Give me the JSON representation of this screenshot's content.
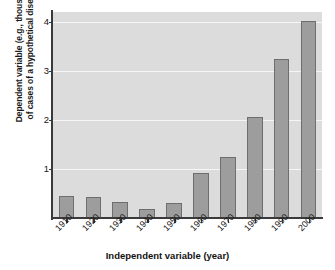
{
  "chart_data": {
    "type": "bar",
    "title": "",
    "xlabel": "Independent variable (year)",
    "ylabel": "Dependent variable (e.g., thousands of cases of a hypothetical disease)",
    "ylabel_line1": "Dependent variable (e.g., thousands",
    "ylabel_line2": "of cases of a hypothetical disease)",
    "categories": [
      "1910",
      "1920",
      "1930",
      "1940",
      "1950",
      "1960",
      "1970",
      "1980",
      "1990",
      "2000"
    ],
    "values": [
      0.45,
      0.42,
      0.32,
      0.18,
      0.3,
      0.92,
      1.25,
      2.05,
      3.25,
      4.02
    ],
    "yticks": [
      "1",
      "2",
      "3",
      "4"
    ],
    "ytick_values": [
      1,
      2,
      3,
      4
    ],
    "ylim": [
      0,
      4.2
    ],
    "grid": true,
    "grid_axis": "y",
    "legend": "none",
    "bar_color": "#9d9d9d",
    "bar_edge_color": "#6e6e6e",
    "plot_background": "#dcdcdc",
    "grid_color": "#f6f6f6",
    "axis_color": "#3a3a3a",
    "page_background": "#ffffff",
    "xtick_label_rotation": -45
  }
}
